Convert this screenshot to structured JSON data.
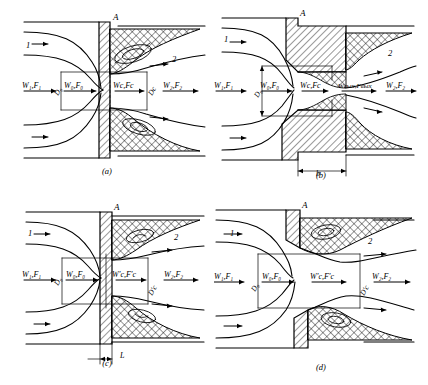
{
  "figure": {
    "type": "technical-line-diagram",
    "panel_count": 4
  },
  "labels": {
    "inlet_stream": "1",
    "outlet_stream": "2",
    "corner_point": "A",
    "w1f1": "W₁,F₁",
    "w0f0": "W₀,F₀",
    "wcfc": "Wс,Fс",
    "wcfc_prime": "W′с,F′с",
    "wvyh": "Wвых,Fвых",
    "w2f2": "W₂,F₂",
    "d0": "D₀",
    "dc": "Dс",
    "dc_prime": "D′с",
    "b": "b",
    "L": "L"
  },
  "panels": [
    {
      "id": "a",
      "caption": "(a)",
      "wall": "thin-sharp-edged-orifice",
      "flow_labels": [
        "W₁,F₁",
        "W₀,F₀",
        "Wс,Fс",
        "W₂,F₂"
      ],
      "dimension_labels": [
        "D₀",
        "Dс"
      ],
      "stream_labels": [
        "1",
        "2"
      ],
      "point_label": "A",
      "has_length_dimension": false,
      "length_label": ""
    },
    {
      "id": "b",
      "caption": "(b)",
      "wall": "thick-walled-orifice",
      "flow_labels": [
        "W₁,F₁",
        "W₀,F₀",
        "Wс,Fс",
        "Wвых,Fвых",
        "W₂,F₂"
      ],
      "dimension_labels": [
        "D₀"
      ],
      "stream_labels": [
        "1",
        "2"
      ],
      "point_label": "A",
      "has_length_dimension": true,
      "length_label": "b"
    },
    {
      "id": "c",
      "caption": "(c)",
      "wall": "short-thickness-orifice",
      "flow_labels": [
        "W₁,F₁",
        "W₀,F₀",
        "W′с,F′с",
        "W₂,F₂"
      ],
      "dimension_labels": [
        "D₀",
        "D′с"
      ],
      "stream_labels": [
        "1",
        "2"
      ],
      "point_label": "A",
      "has_length_dimension": true,
      "length_label": "L"
    },
    {
      "id": "d",
      "caption": "(d)",
      "wall": "stepped-sudden-expansion",
      "flow_labels": [
        "W₁,F₁",
        "W₀,F₀",
        "W′с,F′с",
        "W₂,F₂"
      ],
      "dimension_labels": [
        "D₀",
        "D′с"
      ],
      "stream_labels": [
        "1",
        "2"
      ],
      "point_label": "A",
      "has_length_dimension": false,
      "length_label": ""
    }
  ],
  "colors": {
    "line": "#000000",
    "background": "#ffffff"
  }
}
